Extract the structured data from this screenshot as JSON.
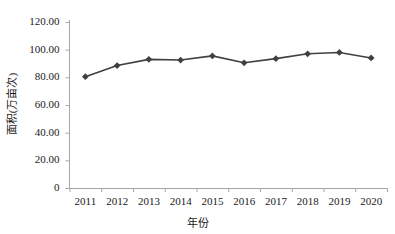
{
  "chart_data": {
    "type": "line",
    "title": "",
    "xlabel": "年份",
    "ylabel": "面积(万亩次)",
    "categories": [
      "2011",
      "2012",
      "2013",
      "2014",
      "2015",
      "2016",
      "2017",
      "2018",
      "2019",
      "2020"
    ],
    "values": [
      80.5,
      88.5,
      93.0,
      92.5,
      95.5,
      90.5,
      93.5,
      97.0,
      98.0,
      94.0
    ],
    "series": [
      {
        "name": "面积(万亩次)",
        "values": [
          80.5,
          88.5,
          93.0,
          92.5,
          95.5,
          90.5,
          93.5,
          97.0,
          98.0,
          94.0
        ]
      }
    ],
    "ylim": [
      0,
      120
    ],
    "yticks": [
      0,
      20,
      40,
      60,
      80,
      100,
      120
    ],
    "ytick_labels": [
      "0",
      "20.00",
      "40.00",
      "60.00",
      "80.00",
      "100.00",
      "120.00"
    ],
    "xtick_labels": [
      "2011",
      "2012",
      "2013",
      "2014",
      "2015",
      "2016",
      "2017",
      "2018",
      "2019",
      "2020"
    ],
    "grid": false,
    "legend": "none",
    "line_color": "#404040",
    "marker": "diamond",
    "marker_color": "#404040",
    "axis_color": "#a6a6a6"
  },
  "colors": {
    "line": "#404040",
    "marker": "#404040",
    "axis": "#a6a6a6",
    "text": "#1a1a1a",
    "background": "#ffffff"
  }
}
